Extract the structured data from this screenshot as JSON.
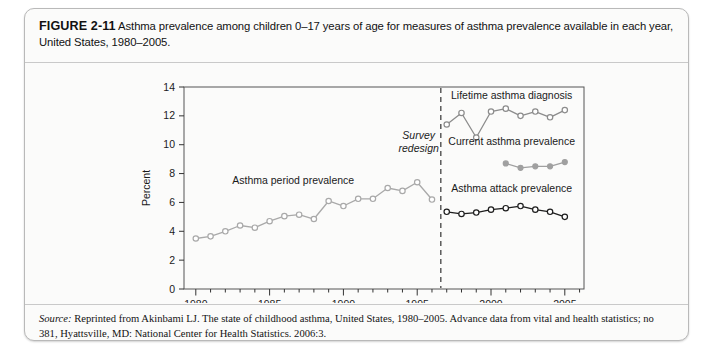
{
  "figure": {
    "label": "FIGURE 2-11",
    "caption": "Asthma prevalence among children 0–17 years of age for measures of asthma prevalence available in each year, United States, 1980–2005."
  },
  "source": {
    "prefix": "Source:",
    "text": "Reprinted from Akinbami LJ. The state of childhood asthma, United States, 1980–2005. Advance data from vital and health statistics; no 381, Hyattsville, MD: National Center for Health Statistics. 2006:3."
  },
  "chart_data": {
    "type": "line",
    "title": "",
    "xlabel": "",
    "ylabel": "Percent",
    "xlim": [
      1979.2,
      2006.3
    ],
    "ylim": [
      0,
      14
    ],
    "yticks": [
      0,
      2,
      4,
      6,
      8,
      10,
      12,
      14
    ],
    "ytick_labels": [
      "0",
      "2",
      "4",
      "6",
      "8",
      "10",
      "12",
      "14"
    ],
    "xticks_major": [
      1980,
      1985,
      1990,
      1995,
      2000,
      2005
    ],
    "xtick_labels": [
      "1980",
      "1985",
      "1990",
      "1995",
      "2000",
      "2005"
    ],
    "xticks_minor": [
      1981,
      1982,
      1983,
      1984,
      1986,
      1987,
      1988,
      1989,
      1991,
      1992,
      1993,
      1994,
      1996,
      1997,
      1998,
      1999,
      2001,
      2002,
      2003,
      2004,
      2006
    ],
    "grid": false,
    "legend_position": "inline-annotations",
    "annotations": [
      {
        "name": "survey-redesign",
        "lines": [
          "Survey",
          "redesign"
        ],
        "x": 1995.1,
        "y": 10.4,
        "style": "italic"
      }
    ],
    "reference_lines": [
      {
        "name": "survey-redesign-line",
        "orientation": "vertical",
        "x": 1996.6,
        "style": "dashed",
        "color": "#333333"
      }
    ],
    "series": [
      {
        "name": "Asthma period prevalence",
        "label": "Asthma period prevalence",
        "label_x": 1986.6,
        "label_y": 7.3,
        "marker": "open-circle",
        "color": "#a9a9a9",
        "x": [
          1980,
          1981,
          1982,
          1983,
          1984,
          1985,
          1986,
          1987,
          1988,
          1989,
          1990,
          1991,
          1992,
          1993,
          1994,
          1995,
          1996
        ],
        "y": [
          3.5,
          3.65,
          4.0,
          4.4,
          4.25,
          4.7,
          5.05,
          5.15,
          4.85,
          6.1,
          5.75,
          6.25,
          6.25,
          7.0,
          6.8,
          7.4,
          6.2
        ]
      },
      {
        "name": "Lifetime asthma diagnosis",
        "label": "Lifetime asthma diagnosis",
        "label_x": 2001.4,
        "label_y": 13.2,
        "marker": "open-circle",
        "color": "#8c8c8c",
        "x": [
          1997,
          1998,
          1999,
          2000,
          2001,
          2002,
          2003,
          2004,
          2005
        ],
        "y": [
          11.4,
          12.2,
          10.5,
          12.3,
          12.5,
          12.0,
          12.3,
          11.9,
          12.4
        ]
      },
      {
        "name": "Current asthma prevalence",
        "label": "Current asthma prevalence",
        "label_x": 2001.4,
        "label_y": 10.0,
        "marker": "filled-circle",
        "color": "#a0a0a0",
        "x": [
          2001,
          2002,
          2003,
          2004,
          2005
        ],
        "y": [
          8.7,
          8.4,
          8.5,
          8.5,
          8.8
        ]
      },
      {
        "name": "Asthma attack prevalence",
        "label": "Asthma attack prevalence",
        "label_x": 2001.4,
        "label_y": 6.7,
        "marker": "open-circle",
        "color": "#1e1e1e",
        "x": [
          1997,
          1998,
          1999,
          2000,
          2001,
          2002,
          2003,
          2004,
          2005
        ],
        "y": [
          5.35,
          5.2,
          5.3,
          5.5,
          5.6,
          5.75,
          5.5,
          5.35,
          5.0
        ]
      }
    ]
  }
}
